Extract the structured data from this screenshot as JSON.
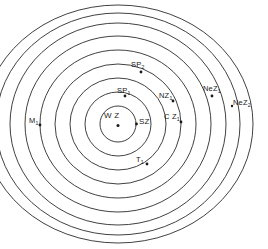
{
  "diagram": {
    "type": "concentric-zone-model",
    "background_color": "#ffffff",
    "stroke_color": "#2b2b2b",
    "center": {
      "x": 118,
      "y": 124
    },
    "ring_count": 9,
    "ring_radii_px": [
      18,
      33,
      48,
      63,
      78,
      93,
      108,
      122,
      135
    ],
    "center_dot": {
      "x": 118,
      "y": 125,
      "r": 1.4
    },
    "labels": [
      {
        "id": "wz",
        "text": "W Z",
        "sub": "",
        "x": 104,
        "y": 115,
        "marker": {
          "x": 118,
          "y": 125
        },
        "description": "innermost zone label"
      },
      {
        "id": "sz",
        "text": "SZ",
        "sub": "",
        "x": 139,
        "y": 117,
        "marker": {
          "x": 136,
          "y": 124
        },
        "description": "second zone label"
      },
      {
        "id": "sp1",
        "text": "SP",
        "sub": "1",
        "x": 117,
        "y": 88,
        "marker": {
          "x": 124,
          "y": 96
        },
        "description": "third zone label, top"
      },
      {
        "id": "nz1",
        "text": "NZ",
        "sub": "1",
        "x": 159,
        "y": 93,
        "marker": {
          "x": 172,
          "y": 101
        },
        "description": "fourth zone label, upper right"
      },
      {
        "id": "cz1",
        "text": "C Z",
        "sub": "1",
        "x": 164,
        "y": 113,
        "marker": {
          "x": 180,
          "y": 121
        },
        "description": "fifth zone label, right"
      },
      {
        "id": "sp2",
        "text": "SP",
        "sub": "2",
        "x": 131,
        "y": 62,
        "marker": {
          "x": 140,
          "y": 72
        },
        "description": "sixth zone label, top"
      },
      {
        "id": "t1",
        "text": "T",
        "sub": "1",
        "x": 135,
        "y": 157,
        "marker": {
          "x": 146,
          "y": 163
        },
        "description": "seventh zone label, bottom"
      },
      {
        "id": "m1",
        "text": "M",
        "sub": "1",
        "x": 29,
        "y": 117,
        "marker": {
          "x": 39,
          "y": 124
        },
        "description": "eighth zone label, left"
      },
      {
        "id": "nez1",
        "text": "NeZ",
        "sub": "1",
        "x": 204,
        "y": 86,
        "marker": {
          "x": 211,
          "y": 95
        },
        "description": "outer zone label, upper right"
      },
      {
        "id": "nez2",
        "text": "NeZ",
        "sub": "2",
        "x": 234,
        "y": 100,
        "marker": {
          "x": 232,
          "y": 105
        },
        "description": "outermost zone label, right"
      }
    ]
  }
}
